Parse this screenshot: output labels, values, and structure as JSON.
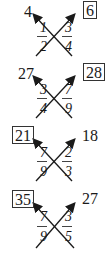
{
  "diagrams": [
    {
      "left_fraction": {
        "numerator": "1",
        "denominator": "2"
      },
      "right_fraction": {
        "numerator": "3",
        "denominator": "4"
      },
      "left_product": "4",
      "right_product": "6",
      "boxed": "right"
    },
    {
      "left_fraction": {
        "numerator": "3",
        "denominator": "4"
      },
      "right_fraction": {
        "numerator": "7",
        "denominator": "9"
      },
      "left_product": "27",
      "right_product": "28",
      "boxed": "right"
    },
    {
      "left_fraction": {
        "numerator": "7",
        "denominator": "9"
      },
      "right_fraction": {
        "numerator": "2",
        "denominator": "3"
      },
      "left_product": "21",
      "right_product": "18",
      "boxed": "left"
    },
    {
      "left_fraction": {
        "numerator": "7",
        "denominator": "9"
      },
      "right_fraction": {
        "numerator": "3",
        "denominator": "5"
      },
      "left_product": "35",
      "right_product": "27",
      "boxed": "left"
    }
  ],
  "colors": {
    "ink": "#1a1a1a",
    "background": "#ffffff"
  }
}
